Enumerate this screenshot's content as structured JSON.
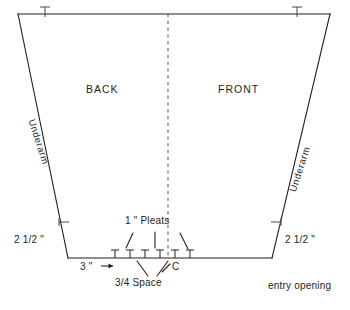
{
  "diagram": {
    "type": "garment-pattern-trapezoid",
    "title_visible": false,
    "stroke_color": "#231f20",
    "background_color": "#ffffff",
    "panels": {
      "back_label": "BACK",
      "front_label": "FRONT"
    },
    "edge_labels": {
      "underarm_left": "Underarm",
      "underarm_right": "Underarm"
    },
    "dimensions": {
      "left_underarm_hem": "2 1/2 \"",
      "right_underarm_hem": "2 1/2 \"",
      "hem_offset": "3 \"",
      "hem_offset_arrow": "→",
      "pleat_width": "1 \" Pleats",
      "pleat_spacing": "3/4 Space",
      "center_mark": "C"
    },
    "notes": {
      "entry_opening": "entry opening"
    },
    "geometry": {
      "top_left": [
        18,
        14
      ],
      "top_right": [
        330,
        14
      ],
      "bottom_left": [
        68,
        258
      ],
      "bottom_right": [
        272,
        258
      ],
      "center_line_x": 168,
      "center_line_dashed": true,
      "top_tick_left_x": 45,
      "top_tick_right_x": 297,
      "side_tick_y": 222,
      "hem_tick_xs": [
        115,
        130,
        145,
        160,
        175,
        190
      ],
      "pleat_fold_marks": 3
    }
  }
}
